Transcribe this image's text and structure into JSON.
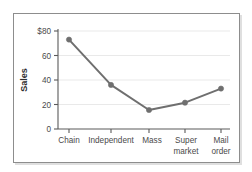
{
  "chart_data": {
    "type": "line",
    "title": "",
    "xlabel": "",
    "ylabel": "Sales",
    "categories": [
      "Chain",
      "Independent",
      "Mass",
      "Super market",
      "Mail order"
    ],
    "values": [
      73,
      36,
      15.5,
      21.5,
      33
    ],
    "series": [
      {
        "name": "Sales",
        "values": [
          73,
          36,
          15.5,
          21.5,
          33
        ]
      }
    ],
    "ylim": [
      0,
      80
    ],
    "y_ticks": [
      0,
      20,
      40,
      60,
      80
    ],
    "y_tick_labels": [
      "0",
      "20",
      "40",
      "60",
      "$80"
    ],
    "grid": true,
    "grid_axis": "y",
    "legend": false,
    "legend_position": "none",
    "marker": "circle",
    "line_color": "#6f6f6f",
    "marker_color": "#6f6f6f",
    "grid_color": "#e9e9e9",
    "axis_color": "#5a5a5a",
    "text_color": "#4a4a4a",
    "background_color": "#ffffff",
    "frame_border_color": "#8d8d8d"
  },
  "axis": {
    "y_title": "Sales",
    "y_tick_0": "0",
    "y_tick_1": "20",
    "y_tick_2": "40",
    "y_tick_3": "60",
    "y_tick_4": "$80"
  },
  "categories": {
    "cat_0_line_0": "Chain",
    "cat_0_line_1": "",
    "cat_1_line_0": "Independent",
    "cat_1_line_1": "",
    "cat_2_line_0": "Mass",
    "cat_2_line_1": "",
    "cat_3_line_0": "Super",
    "cat_3_line_1": "market",
    "cat_4_line_0": "Mail",
    "cat_4_line_1": "order"
  }
}
